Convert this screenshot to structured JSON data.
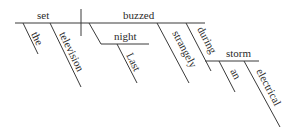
{
  "diagram": {
    "type": "sentence-diagram",
    "subject": "set",
    "verb": "buzzed",
    "modifiers": {
      "subject": [
        "the",
        "television"
      ],
      "adverbial_noun": "night",
      "adverbial_noun_modifier": "Last",
      "verb_adverb": "strangely",
      "preposition": "during",
      "prepositional_object": "storm",
      "object_modifiers": [
        "an",
        "electrical"
      ]
    },
    "colors": {
      "line": "#3a3a3a",
      "text": "#2a2a2a",
      "background": "#ffffff"
    }
  }
}
